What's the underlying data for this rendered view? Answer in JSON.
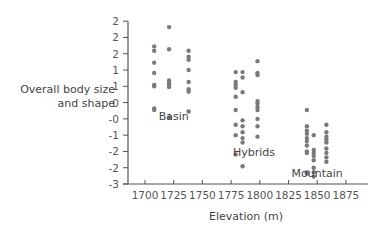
{
  "chart_data": {
    "type": "scatter",
    "title": "",
    "xlabel": "Elevation (m)",
    "ylabel_lines": [
      "Overall body size",
      "and shape"
    ],
    "xlim": [
      1682,
      1885
    ],
    "ylim": [
      -3,
      2.5
    ],
    "grid": false,
    "legend": "none (groups labeled inline)",
    "x_ticks": [
      1700,
      1725,
      1750,
      1775,
      1800,
      1825,
      1850,
      1875
    ],
    "x_tick_labels": [
      "1700",
      "1725",
      "1750",
      "1775",
      "1800",
      "1825",
      "1850",
      "1875"
    ],
    "y_ticks": [
      2.5,
      1.95,
      1.4,
      0.85,
      0.3,
      -0.25,
      -0.8,
      -1.35,
      -1.9,
      -2.45,
      -3.0
    ],
    "y_tick_labels": [
      "2",
      "2",
      "2",
      "1",
      "1",
      "0",
      "-0",
      "-1",
      "-2",
      "-2",
      "-3"
    ],
    "dot_color": "#7a7a7a",
    "series": [
      {
        "name": "Basin",
        "label_pos": {
          "x": 1725,
          "y": -0.85
        },
        "points": [
          {
            "x": 1708,
            "y": 1.65
          },
          {
            "x": 1708,
            "y": 1.5
          },
          {
            "x": 1708,
            "y": 1.1
          },
          {
            "x": 1708,
            "y": 0.75
          },
          {
            "x": 1708,
            "y": 0.35
          },
          {
            "x": 1708,
            "y": 0.3
          },
          {
            "x": 1708,
            "y": -0.45
          },
          {
            "x": 1708,
            "y": -0.5
          },
          {
            "x": 1721,
            "y": 2.3
          },
          {
            "x": 1721,
            "y": 1.55
          },
          {
            "x": 1721,
            "y": 0.5
          },
          {
            "x": 1721,
            "y": 0.4
          },
          {
            "x": 1721,
            "y": 0.35
          },
          {
            "x": 1721,
            "y": 0.28
          },
          {
            "x": 1721,
            "y": -0.75
          },
          {
            "x": 1738,
            "y": 1.5
          },
          {
            "x": 1738,
            "y": 1.3
          },
          {
            "x": 1738,
            "y": 1.2
          },
          {
            "x": 1738,
            "y": 0.85
          },
          {
            "x": 1738,
            "y": 0.45
          },
          {
            "x": 1738,
            "y": 0.2
          },
          {
            "x": 1738,
            "y": 0.12
          },
          {
            "x": 1738,
            "y": -0.55
          }
        ]
      },
      {
        "name": "Hybrids",
        "label_pos": {
          "x": 1795,
          "y": -2.05
        },
        "points": [
          {
            "x": 1779,
            "y": 0.78
          },
          {
            "x": 1779,
            "y": 0.45
          },
          {
            "x": 1779,
            "y": 0.35
          },
          {
            "x": 1779,
            "y": 0.25
          },
          {
            "x": 1779,
            "y": -0.05
          },
          {
            "x": 1779,
            "y": -0.5
          },
          {
            "x": 1779,
            "y": -1.0
          },
          {
            "x": 1779,
            "y": -1.35
          },
          {
            "x": 1779,
            "y": -2.0
          },
          {
            "x": 1785,
            "y": 0.78
          },
          {
            "x": 1785,
            "y": 0.6
          },
          {
            "x": 1785,
            "y": 0.1
          },
          {
            "x": 1785,
            "y": -0.85
          },
          {
            "x": 1785,
            "y": -1.05
          },
          {
            "x": 1785,
            "y": -1.25
          },
          {
            "x": 1785,
            "y": -1.45
          },
          {
            "x": 1785,
            "y": -1.6
          },
          {
            "x": 1785,
            "y": -2.4
          },
          {
            "x": 1798,
            "y": 1.15
          },
          {
            "x": 1798,
            "y": 0.75
          },
          {
            "x": 1798,
            "y": 0.68
          },
          {
            "x": 1798,
            "y": -0.2
          },
          {
            "x": 1798,
            "y": -0.28
          },
          {
            "x": 1798,
            "y": -0.4
          },
          {
            "x": 1798,
            "y": -0.5
          },
          {
            "x": 1798,
            "y": -0.8
          },
          {
            "x": 1798,
            "y": -1.05
          },
          {
            "x": 1798,
            "y": -1.4
          }
        ]
      },
      {
        "name": "Mountain",
        "label_pos": {
          "x": 1850,
          "y": -2.75
        },
        "points": [
          {
            "x": 1841,
            "y": -0.5
          },
          {
            "x": 1841,
            "y": -1.05
          },
          {
            "x": 1841,
            "y": -1.2
          },
          {
            "x": 1841,
            "y": -1.3
          },
          {
            "x": 1841,
            "y": -1.45
          },
          {
            "x": 1841,
            "y": -1.55
          },
          {
            "x": 1841,
            "y": -1.7
          },
          {
            "x": 1841,
            "y": -1.9
          },
          {
            "x": 1841,
            "y": -1.95
          },
          {
            "x": 1841,
            "y": -2.6
          },
          {
            "x": 1841,
            "y": -2.65
          },
          {
            "x": 1847,
            "y": -1.35
          },
          {
            "x": 1847,
            "y": -1.85
          },
          {
            "x": 1847,
            "y": -1.95
          },
          {
            "x": 1847,
            "y": -2.05
          },
          {
            "x": 1847,
            "y": -2.2
          },
          {
            "x": 1847,
            "y": -2.45
          },
          {
            "x": 1847,
            "y": -2.6
          },
          {
            "x": 1847,
            "y": -2.75
          },
          {
            "x": 1858,
            "y": -1.0
          },
          {
            "x": 1858,
            "y": -1.25
          },
          {
            "x": 1858,
            "y": -1.4
          },
          {
            "x": 1858,
            "y": -1.5
          },
          {
            "x": 1858,
            "y": -1.6
          },
          {
            "x": 1858,
            "y": -1.8
          },
          {
            "x": 1858,
            "y": -1.95
          },
          {
            "x": 1858,
            "y": -2.1
          },
          {
            "x": 1858,
            "y": -2.25
          }
        ]
      }
    ]
  },
  "axes": {
    "x_title": "Elevation (m)",
    "y_title_line1": "Overall body size",
    "y_title_line2": "and shape"
  },
  "layout": {
    "plot_left": 128,
    "plot_bottom": 184,
    "x_px_per_unit": 1.148,
    "x_origin_value": 1700,
    "x_origin_px": 145,
    "y_px_per_unit": 29.6,
    "y_origin_value": -3,
    "y_origin_px": 184,
    "axis_color": "#555555"
  }
}
